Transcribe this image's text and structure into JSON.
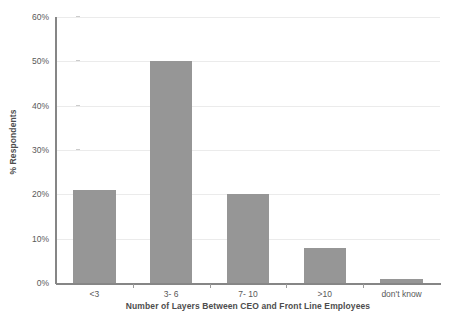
{
  "chart_data": {
    "type": "bar",
    "title": "",
    "subtitle": "",
    "xlabel": "Number of Layers Between CEO and Front Line Employees",
    "ylabel": "% Respondents",
    "categories": [
      "<3",
      "3- 6",
      "7- 10",
      ">10",
      "don't know"
    ],
    "values": [
      21,
      50,
      20,
      8,
      1
    ],
    "value_labels": [
      "21%",
      "50%",
      "20%",
      "8%",
      "1%"
    ],
    "ylim": [
      0,
      60
    ],
    "ytick_values": [
      0,
      10,
      20,
      30,
      40,
      50,
      60
    ],
    "ytick_labels": [
      "0%",
      "10%",
      "20%",
      "30%",
      "40%",
      "50%",
      "60%"
    ],
    "grid": "horizontal",
    "legend": "none",
    "series": [
      {
        "name": "% Respondents",
        "values": [
          21,
          50,
          20,
          8,
          1
        ]
      }
    ],
    "colors": {
      "bar_fill": "#969696",
      "gridline": "#ebebeb",
      "axis_line": "#868686",
      "tick_label": "#595959",
      "axis_title": "#4d4d4d",
      "background": "#ffffff"
    }
  }
}
